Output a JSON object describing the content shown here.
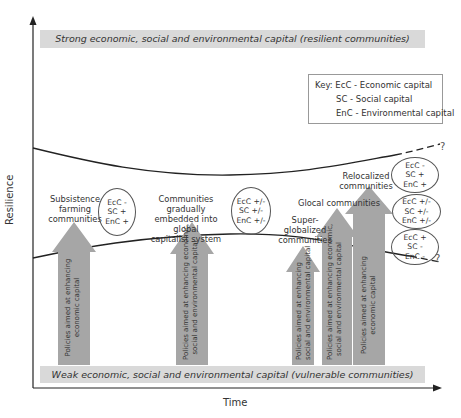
{
  "diagram": {
    "top_band": "Strong economic, social and environmental capital (resilient communities)",
    "bottom_band": "Weak economic, social and environmental capital (vulnerable communities)",
    "y_axis_label": "Resilience",
    "x_axis_label": "Time",
    "key": {
      "title": "Key:",
      "items": [
        "EcC - Economic capital",
        "SC - Social capital",
        "EnC - Environmental capital"
      ]
    },
    "stages": [
      {
        "label": "Subsistence farming communities",
        "lines": [
          "Subsistence",
          "farming",
          "communities"
        ],
        "oval": [
          "EcC -",
          "SC +",
          "EnC +"
        ]
      },
      {
        "label": "Communities gradually embedded into global capitalist system",
        "lines": [
          "Communities gradually",
          "embedded into global",
          "capitalist system"
        ],
        "oval": [
          "EcC +/-",
          "SC +/-",
          "EnC +/-"
        ]
      },
      {
        "label": "Super-globalized communities",
        "lines": [
          "Super-globalized",
          "communities"
        ]
      },
      {
        "label": "Glocal communities",
        "lines": [
          "Glocal communities"
        ]
      },
      {
        "label": "Relocalized communities",
        "lines": [
          "Relocalized",
          "communities"
        ]
      }
    ],
    "future_ovals": [
      [
        "EcC -",
        "SC +",
        "EnC +"
      ],
      [
        "EcC +/-",
        "SC +/-",
        "EnC +/-"
      ],
      [
        "EcC +",
        "SC -",
        "EnC -"
      ]
    ],
    "question_marks": [
      "?",
      "?"
    ],
    "arrows": [
      {
        "lines": [
          "Policies aimed at enhancing",
          "economic capital"
        ]
      },
      {
        "lines": [
          "Policies aimed at enhancing economic,",
          "social and environmental capital"
        ]
      },
      {
        "lines": [
          "Policies aimed at enhancing",
          "social and environmental capital"
        ]
      },
      {
        "lines": [
          "Policies aimed at enhancing economic,",
          "social and environmental capital"
        ]
      },
      {
        "lines": [
          "Policies aimed at enhancing",
          "economic capital"
        ]
      }
    ],
    "colors": {
      "band": "#d9d9d9",
      "arrow": "#a6a6a6",
      "line": "#222222"
    }
  }
}
